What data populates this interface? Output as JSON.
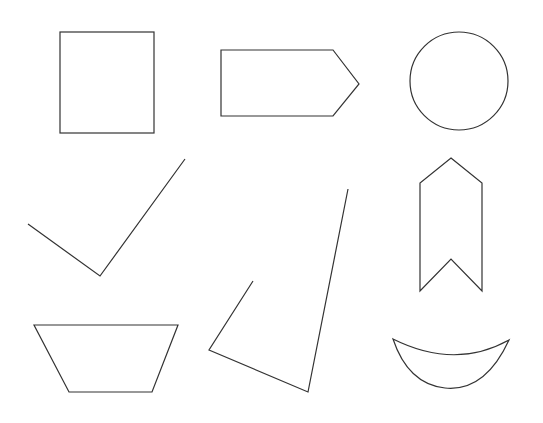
{
  "canvas": {
    "background": "#ffffff"
  },
  "style": {
    "stroke_color": "#333333"
  },
  "shapes": [
    {
      "name": "rectangle",
      "kind": "closed-polygon"
    },
    {
      "name": "pentagon-arrow",
      "kind": "closed-polygon"
    },
    {
      "name": "circle",
      "kind": "ellipse"
    },
    {
      "name": "checkmark",
      "kind": "open-polyline"
    },
    {
      "name": "ribbon-banner",
      "kind": "closed-polygon"
    },
    {
      "name": "open-quadrilateral",
      "kind": "open-polyline"
    },
    {
      "name": "trapezoid",
      "kind": "closed-polygon"
    },
    {
      "name": "crescent",
      "kind": "closed-curve"
    }
  ]
}
